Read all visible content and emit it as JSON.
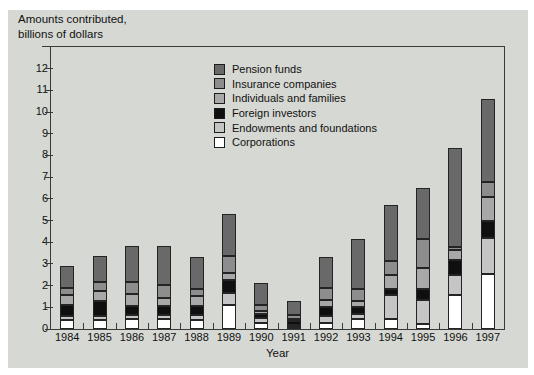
{
  "figure": {
    "title_line1": "Amounts contributed,",
    "title_line2": "billions of dollars"
  },
  "chart_data": {
    "type": "bar",
    "stacked": true,
    "title": "Amounts contributed, billions of dollars",
    "xlabel": "Year",
    "ylabel": "Amounts contributed, billions of dollars",
    "ylim": [
      0,
      13
    ],
    "yticks": [
      0,
      1,
      2,
      3,
      4,
      5,
      6,
      7,
      8,
      9,
      10,
      11,
      12
    ],
    "grid": false,
    "legend_position": "top-inside",
    "categories": [
      "1984",
      "1985",
      "1986",
      "1987",
      "1988",
      "1989",
      "1990",
      "1991",
      "1992",
      "1993",
      "1994",
      "1995",
      "1996",
      "1997"
    ],
    "series_bottom_to_top": [
      {
        "name": "Corporations",
        "color": "#ffffff",
        "values": [
          0.4,
          0.4,
          0.45,
          0.45,
          0.4,
          1.1,
          0.3,
          0.1,
          0.3,
          0.45,
          0.45,
          0.25,
          1.55,
          2.55
        ]
      },
      {
        "name": "Endowments and foundations",
        "color": "#c5c5c5",
        "values": [
          0.2,
          0.2,
          0.2,
          0.2,
          0.25,
          0.55,
          0.2,
          0.1,
          0.3,
          0.25,
          1.1,
          1.1,
          0.95,
          1.65
        ]
      },
      {
        "name": "Foreign investors",
        "color": "#0f0f0f",
        "values": [
          0.5,
          0.7,
          0.4,
          0.4,
          0.4,
          0.6,
          0.2,
          0.15,
          0.4,
          0.3,
          0.3,
          0.5,
          0.7,
          0.8
        ]
      },
      {
        "name": "Individuals and families",
        "color": "#a8a8a8",
        "values": [
          0.45,
          0.45,
          0.55,
          0.4,
          0.45,
          0.35,
          0.15,
          0.1,
          0.35,
          0.3,
          0.65,
          0.95,
          0.45,
          1.1
        ]
      },
      {
        "name": "Insurance companies",
        "color": "#8d8d8d",
        "values": [
          0.35,
          0.4,
          0.55,
          0.6,
          0.35,
          0.75,
          0.25,
          0.2,
          0.55,
          0.55,
          0.65,
          1.35,
          0.15,
          0.7
        ]
      },
      {
        "name": "Pension funds",
        "color": "#696969",
        "values": [
          1.0,
          1.2,
          1.7,
          1.8,
          1.45,
          1.95,
          1.0,
          0.65,
          1.4,
          2.3,
          2.55,
          2.35,
          4.55,
          3.8
        ]
      }
    ],
    "totals": [
      2.9,
      3.35,
      3.85,
      3.85,
      3.3,
      5.3,
      2.1,
      1.3,
      3.3,
      4.15,
      5.7,
      6.5,
      8.35,
      10.6
    ],
    "legend_top_to_bottom": [
      "Pension funds",
      "Insurance companies",
      "Individuals and families",
      "Foreign investors",
      "Endowments and foundations",
      "Corporations"
    ]
  },
  "colors": {
    "panel_background": "#d6d8d3",
    "axis": "#3a3a3a",
    "text": "#111111",
    "segment_border": "#242424"
  }
}
